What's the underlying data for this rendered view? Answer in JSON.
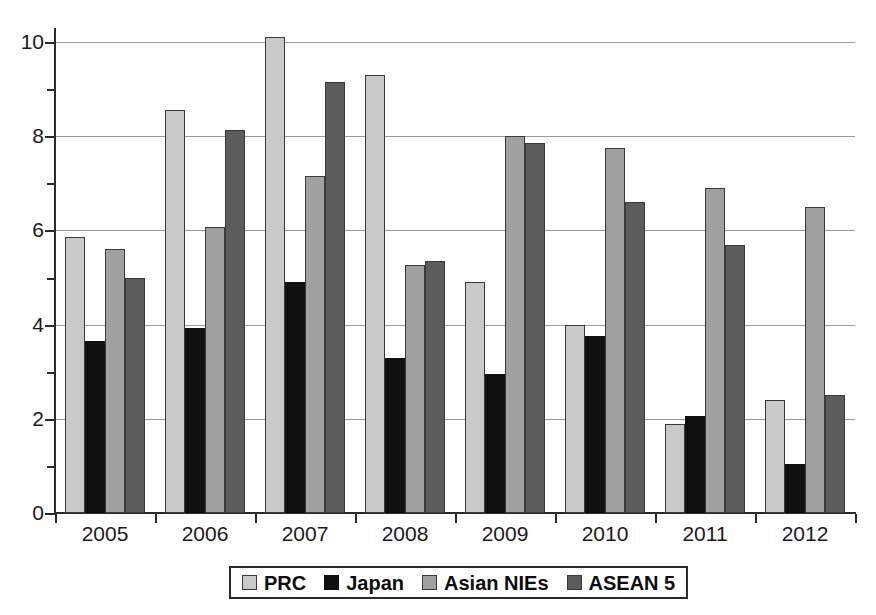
{
  "chart_data": {
    "type": "bar",
    "title": "",
    "subtitle": "",
    "xlabel": "",
    "ylabel": "",
    "categories": [
      "2005",
      "2006",
      "2007",
      "2008",
      "2009",
      "2010",
      "2011",
      "2012"
    ],
    "series": [
      {
        "name": "PRC",
        "color": "#c9c9c9",
        "values": [
          5.85,
          8.55,
          10.1,
          9.3,
          4.9,
          4.0,
          1.9,
          2.4
        ]
      },
      {
        "name": "Japan",
        "color": "#101010",
        "values": [
          3.65,
          3.93,
          4.9,
          3.3,
          2.95,
          3.75,
          2.05,
          1.05
        ]
      },
      {
        "name": "Asian NIEs",
        "color": "#a0a0a0",
        "values": [
          5.6,
          6.08,
          7.15,
          5.27,
          8.0,
          7.75,
          6.9,
          6.5
        ]
      },
      {
        "name": "ASEAN 5",
        "color": "#5c5c5c",
        "values": [
          5.0,
          8.13,
          9.15,
          5.35,
          7.85,
          6.6,
          5.7,
          2.5
        ]
      }
    ],
    "ylim": [
      0,
      10.45
    ],
    "yticks": [
      0,
      2,
      4,
      6,
      8,
      10
    ],
    "ytick_labels": [
      "0",
      "2",
      "4",
      "6",
      "8",
      "10"
    ],
    "yminor_ticks": [
      1,
      3,
      5,
      7,
      9
    ],
    "grid": "horizontal",
    "legend_position": "bottom-center"
  },
  "legend": {
    "items": [
      {
        "label": "PRC"
      },
      {
        "label": "Japan"
      },
      {
        "label": "Asian NIEs"
      },
      {
        "label": "ASEAN 5"
      }
    ]
  },
  "colors": {
    "axis": "#2b2b2b",
    "grid": "#9a9a9a",
    "text": "#1a1a1a",
    "background": "#ffffff"
  }
}
